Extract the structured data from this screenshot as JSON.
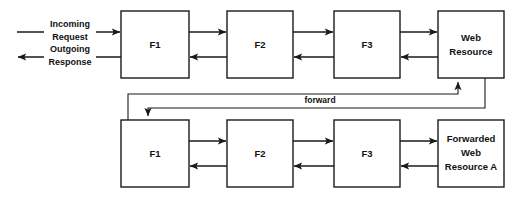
{
  "diagram": {
    "colors": {
      "background": "#ffffff",
      "stroke": "#1a1a1a",
      "box_fill": "#ffffff",
      "text": "#111111"
    },
    "top_chain": {
      "name": "original-request-chain",
      "entry_labels": {
        "incoming_line1": "Incoming",
        "incoming_line2": "Request",
        "outgoing_line1": "Outgoing",
        "outgoing_line2": "Response"
      },
      "nodes": [
        {
          "id": "top-f1",
          "label": "F1",
          "lines": [
            "F1"
          ]
        },
        {
          "id": "top-f2",
          "label": "F2",
          "lines": [
            "F2"
          ]
        },
        {
          "id": "top-f3",
          "label": "F3",
          "lines": [
            "F3"
          ]
        },
        {
          "id": "top-web-resource",
          "label": "Web Resource",
          "lines": [
            "Web",
            "Resource"
          ]
        }
      ]
    },
    "bottom_chain": {
      "name": "forwarded-request-chain",
      "nodes": [
        {
          "id": "bottom-f1",
          "label": "F1",
          "lines": [
            "F1"
          ]
        },
        {
          "id": "bottom-f2",
          "label": "F2",
          "lines": [
            "F2"
          ]
        },
        {
          "id": "bottom-f3",
          "label": "F3",
          "lines": [
            "F3"
          ]
        },
        {
          "id": "bottom-forwarded-resource",
          "label": "Forwarded Web Resource A",
          "lines": [
            "Forwarded",
            "Web",
            "Resource A"
          ]
        }
      ]
    },
    "connectors": {
      "forward_label": "forward"
    }
  }
}
